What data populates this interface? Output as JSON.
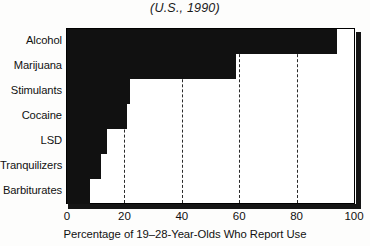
{
  "chart_data": {
    "type": "bar",
    "orientation": "horizontal",
    "title": "(U.S., 1990)",
    "xlabel": "Percentage of 19–28-Year-Olds Who Report Use",
    "ylabel": "",
    "categories": [
      "Alcohol",
      "Marijuana",
      "Stimulants",
      "Cocaine",
      "LSD",
      "Tranquilizers",
      "Barbiturates"
    ],
    "values": [
      94,
      59,
      22,
      21,
      14,
      12,
      8
    ],
    "xlim": [
      0,
      100
    ],
    "xticks": [
      0,
      20,
      40,
      60,
      80,
      100
    ],
    "xtick_labels": [
      "0",
      "20",
      "40",
      "60",
      "80",
      "100"
    ],
    "grid": "vertical-dashed",
    "legend": "none",
    "bar_color": "#111111",
    "plot_background": "#ffffff",
    "frame_color": "#000000",
    "shadow_color": "#151515"
  }
}
